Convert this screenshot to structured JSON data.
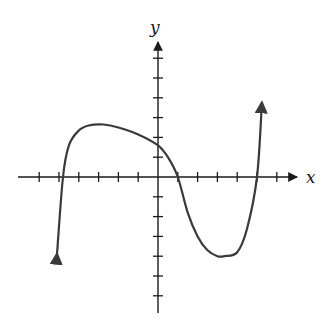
{
  "chart_data": {
    "type": "line",
    "title": "",
    "xlabel": "x",
    "ylabel": "y",
    "xlim": [
      -7,
      7
    ],
    "ylim": [
      -7,
      7
    ],
    "grid": false,
    "tick_spacing": 1,
    "tick_labels_shown": false,
    "x_ticks": [
      -6,
      -5,
      -4,
      -3,
      -2,
      -1,
      1,
      2,
      3,
      4,
      5,
      6
    ],
    "y_ticks": [
      -6,
      -5,
      -4,
      -3,
      -2,
      -1,
      1,
      2,
      3,
      4,
      5,
      6
    ],
    "series": [
      {
        "name": "f(x)",
        "x_intercepts": [
          -4.8,
          1,
          5
        ],
        "y_intercept": 1.6,
        "local_max": [
          -2.75,
          2.65
        ],
        "local_min": [
          3.35,
          -4.0
        ],
        "end_behavior": {
          "left": "down",
          "right": "up"
        },
        "left_endpoint": [
          -5.1,
          -3.9
        ],
        "right_endpoint": [
          5.25,
          3.75
        ],
        "points": [
          [
            -5.1,
            -3.9
          ],
          [
            -4.8,
            0
          ],
          [
            -4.5,
            1.6
          ],
          [
            -4.0,
            2.35
          ],
          [
            -3.5,
            2.6
          ],
          [
            -2.75,
            2.65
          ],
          [
            -2.0,
            2.5
          ],
          [
            -1.0,
            2.15
          ],
          [
            0,
            1.6
          ],
          [
            0.5,
            1.0
          ],
          [
            1,
            0
          ],
          [
            1.5,
            -1.8
          ],
          [
            2.0,
            -3.0
          ],
          [
            2.5,
            -3.7
          ],
          [
            3.0,
            -4.0
          ],
          [
            3.35,
            -4.0
          ],
          [
            4.0,
            -3.8
          ],
          [
            4.5,
            -2.6
          ],
          [
            5,
            0
          ],
          [
            5.25,
            3.75
          ]
        ]
      }
    ]
  },
  "labels": {
    "x_axis": "x",
    "y_axis": "y"
  },
  "colors": {
    "axis": "#1a1a1a",
    "curve": "#3a3a3a",
    "background": "#ffffff"
  }
}
